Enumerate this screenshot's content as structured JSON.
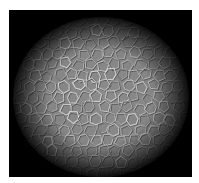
{
  "image": {
    "subject": "cellular tissue micrograph",
    "description": "Grayscale micrograph of a dense layer of polygonal cells with bright cell borders, fading to black toward the edges (circular vignette)",
    "colors": {
      "background": "#ffffff",
      "frame": "#050505",
      "cell_fill": "#8c8c8c",
      "cell_border_highlight": "#e6e6e6",
      "cell_border_shadow": "#5a5a5a"
    },
    "cell_pattern_seed": 7
  }
}
